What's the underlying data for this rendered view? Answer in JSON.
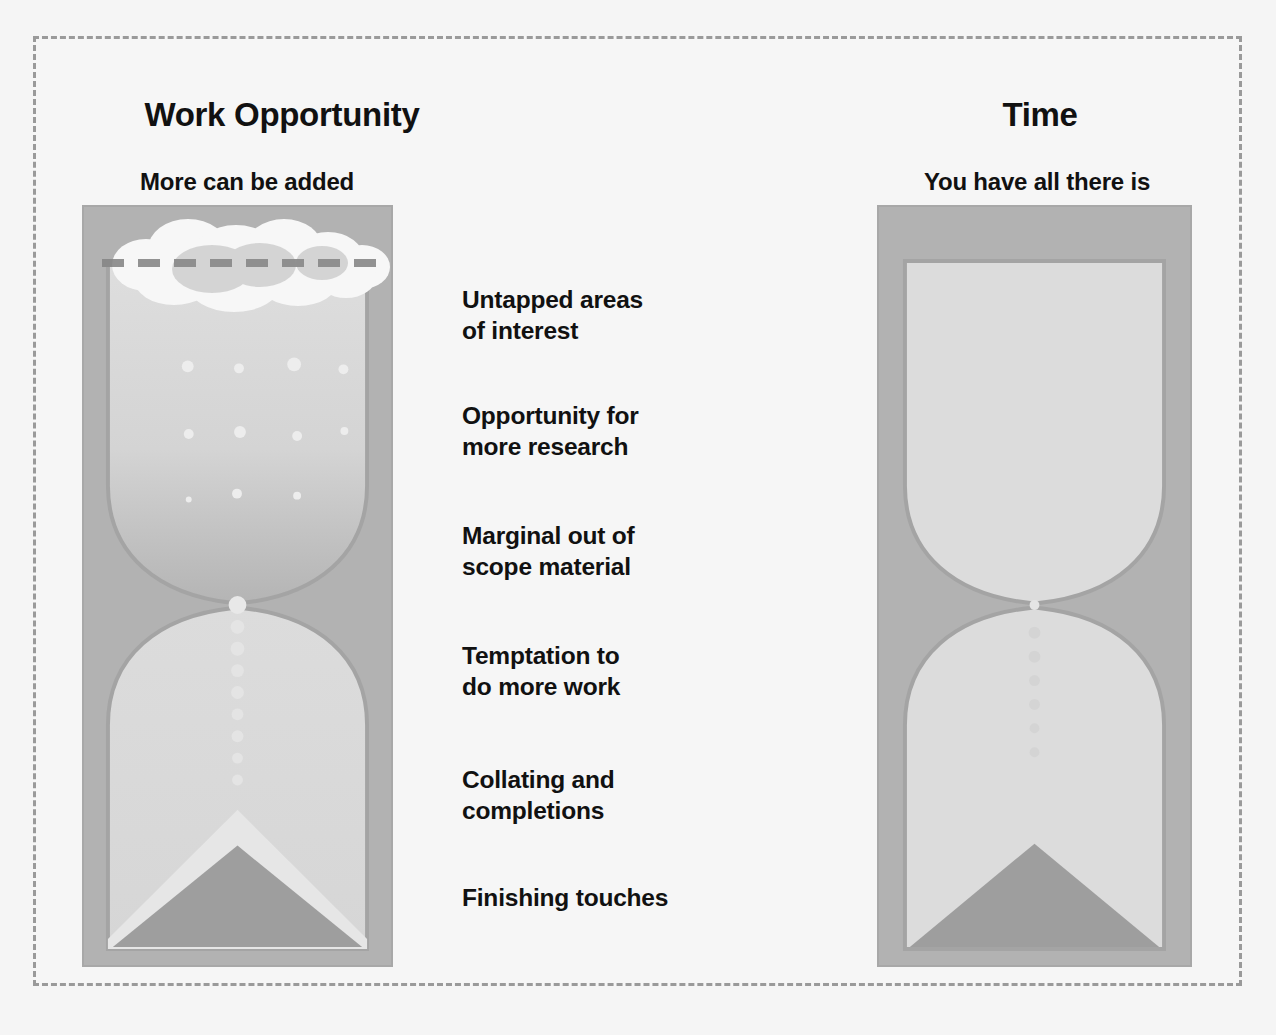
{
  "slide": {
    "background_color": "#f5f5f5",
    "border_color": "#9a9a9a",
    "border_style": "dashed"
  },
  "columns": [
    {
      "key": "work_opportunity",
      "title": "Work Opportunity",
      "subtitle": "More can be added"
    },
    {
      "key": "time",
      "title": "Time",
      "subtitle": "You have all there is"
    }
  ],
  "captions": [
    "Untapped areas\nof interest",
    "Opportunity for\nmore research",
    "Marginal out of\nscope material",
    "Temptation to\ndo more work",
    "Collating and\ncompletions",
    "Finishing touches"
  ],
  "icons": {
    "left_hourglass": "hourglass-icon",
    "right_hourglass": "hourglass-icon",
    "cloud": "cloud-icon",
    "dashed_cap_line": "dashed-line-icon",
    "falling_sand": "sand-particles-icon",
    "sand_pile": "sand-pile-icon"
  },
  "colors": {
    "frame_fill": "#b2b2b2",
    "frame_border": "#a8a8a8",
    "glass_outline": "#a0a0a0",
    "glass_fill_light": "#dcdcdc",
    "sand_light": "#d2d2d2",
    "sand_dark": "#9a9a9a",
    "cloud": "#fbfbfb",
    "dashed_line": "#8c8c8c",
    "text": "#111111"
  }
}
